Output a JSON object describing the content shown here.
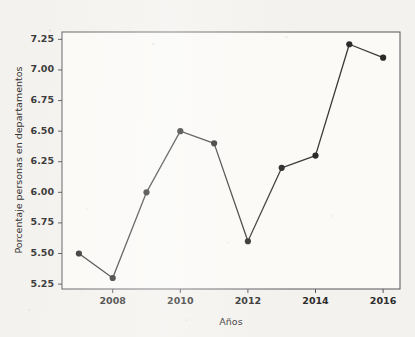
{
  "chart_data": {
    "type": "line",
    "title": "",
    "subtitle": "",
    "xlabel": "Años",
    "ylabel": "Porcentaje personas en departamentos",
    "x": [
      2007,
      2008,
      2009,
      2010,
      2011,
      2012,
      2013,
      2014,
      2015,
      2016
    ],
    "values": [
      5.5,
      5.3,
      6.0,
      6.5,
      6.4,
      5.6,
      6.2,
      6.3,
      7.21,
      7.1
    ],
    "series": [
      {
        "name": "Porcentaje personas en departamentos",
        "values": [
          5.5,
          5.3,
          6.0,
          6.5,
          6.4,
          5.6,
          6.2,
          6.3,
          7.21,
          7.1
        ]
      }
    ],
    "xlim": [
      2006.5,
      2016.5
    ],
    "ylim": [
      5.21,
      7.31
    ],
    "xticks": [
      2008,
      2010,
      2012,
      2014,
      2016
    ],
    "xtick_labels": [
      "2008",
      "2010",
      "2012",
      "2014",
      "2016"
    ],
    "yticks": [
      5.25,
      5.5,
      5.75,
      6.0,
      6.25,
      6.5,
      6.75,
      7.0,
      7.25
    ],
    "ytick_labels": [
      "5.25",
      "5.50",
      "5.75",
      "6.00",
      "6.25",
      "6.50",
      "6.75",
      "7.00",
      "7.25"
    ],
    "grid": false,
    "legend": false,
    "legend_position": "none",
    "marker": "circle",
    "annotations": []
  },
  "style": {
    "background_color": "#f4f2ee",
    "plot_background_color": "#fbfaf7",
    "line_color": "#3a3a3a",
    "marker_color": "#2b2b2b",
    "axis_color": "#55555a",
    "text_color": "#2c2c2c"
  },
  "icons": {
    "data_point": "circle-marker-icon"
  }
}
